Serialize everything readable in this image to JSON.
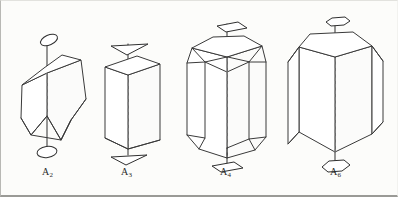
{
  "figure": {
    "caption_present": false,
    "background_color": "#fcfcfa",
    "line_color": "#3a3a3a",
    "hidden_line_color": "#8a8a8a",
    "border_color": "#9a9a96"
  },
  "crystals": [
    {
      "id": "a2",
      "label": "A",
      "subscript": "2",
      "axis_order": 2,
      "symbol_name": "lens-marker",
      "symbol_shape": "ellipse",
      "description": "tilted prism with wedge termination and two-fold axis",
      "label_x": 42,
      "label_y": 172
    },
    {
      "id": "a3",
      "label": "A",
      "subscript": "3",
      "axis_order": 3,
      "symbol_name": "triangle-marker",
      "symbol_shape": "triangle",
      "description": "triangular prism with three-fold axis",
      "label_x": 122,
      "label_y": 172
    },
    {
      "id": "a4",
      "label": "A",
      "subscript": "4",
      "axis_order": 4,
      "symbol_name": "square-marker",
      "symbol_shape": "square",
      "description": "tetragonal prism with truncated corners and four-fold axis",
      "label_x": 221,
      "label_y": 172
    },
    {
      "id": "a6",
      "label": "A",
      "subscript": "6",
      "axis_order": 6,
      "symbol_name": "hexagon-marker",
      "symbol_shape": "hexagon",
      "description": "hexagonal prism with six-fold axis",
      "label_x": 331,
      "label_y": 172
    }
  ]
}
